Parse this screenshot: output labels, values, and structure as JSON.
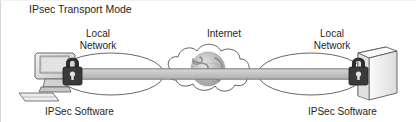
{
  "diagram": {
    "title": "IPsec Transport Mode",
    "background_color": "#ffffff",
    "text_color": "#262626",
    "pipe_color": "#c9c9c9",
    "outline_color": "#4d4d4d",
    "lock_color": "#333333",
    "nodes": [
      {
        "id": "host-left",
        "icon": "desktop-computer-icon",
        "label": "IPSec Software",
        "lock": true
      },
      {
        "id": "host-right",
        "icon": "server-tower-icon",
        "label": "IPSec Software",
        "lock": true
      }
    ],
    "clouds": [
      {
        "id": "local-network-left",
        "shape": "ellipse",
        "label": "Local\nNetwork",
        "label_line1": "Local",
        "label_line2": "Network"
      },
      {
        "id": "internet",
        "shape": "cloud",
        "label": "Internet",
        "contains": "globe-icon"
      },
      {
        "id": "local-network-right",
        "shape": "ellipse",
        "label": "Local\nNetwork",
        "label_line1": "Local",
        "label_line2": "Network"
      }
    ],
    "connection": {
      "id": "ipsec-transport-pipe",
      "description": "encrypted payload channel spanning end to end",
      "style": "gray-band"
    }
  }
}
